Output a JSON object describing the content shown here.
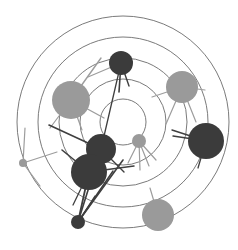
{
  "figure": {
    "title": "",
    "type": "radial-network-graph",
    "width": 238,
    "height": 250,
    "background": "#ffffff"
  },
  "colors": {
    "ring_stroke": "#6b6b6b",
    "node_dark": "#3b3b3b",
    "node_gray": "#9a9a9a",
    "edge_dark": "#3f3f3f",
    "edge_gray": "#9d9d9d"
  },
  "rings": {
    "center_x": 123,
    "center_y": 122,
    "stroke_width": 0.9,
    "radii": [
      106,
      85,
      64,
      43,
      23
    ]
  },
  "nodes": [
    {
      "id": "n1",
      "label": "top-dark",
      "cx": 121,
      "cy": 63,
      "r": 12,
      "color": "#3b3b3b"
    },
    {
      "id": "n2",
      "label": "upper-left-gray",
      "cx": 71,
      "cy": 100,
      "r": 19,
      "color": "#9a9a9a"
    },
    {
      "id": "n3",
      "label": "upper-right-gray",
      "cx": 182,
      "cy": 87,
      "r": 16,
      "color": "#9a9a9a"
    },
    {
      "id": "n4",
      "label": "right-dark",
      "cx": 206,
      "cy": 141,
      "r": 18,
      "color": "#3b3b3b"
    },
    {
      "id": "n5",
      "label": "center-small-gray",
      "cx": 139,
      "cy": 141,
      "r": 7,
      "color": "#9a9a9a"
    },
    {
      "id": "n6",
      "label": "inner-dark-upper",
      "cx": 101,
      "cy": 149,
      "r": 15,
      "color": "#3b3b3b"
    },
    {
      "id": "n7",
      "label": "inner-dark-lower",
      "cx": 89,
      "cy": 172,
      "r": 18,
      "color": "#3b3b3b"
    },
    {
      "id": "n8",
      "label": "bottom-small-dark",
      "cx": 78,
      "cy": 222,
      "r": 7,
      "color": "#3b3b3b"
    },
    {
      "id": "n9",
      "label": "bottom-gray",
      "cx": 158,
      "cy": 215,
      "r": 16,
      "color": "#9a9a9a"
    },
    {
      "id": "n10",
      "label": "far-left-small",
      "cx": 23,
      "cy": 163,
      "r": 4,
      "color": "#9a9a9a"
    }
  ],
  "edges": [
    {
      "x1": 121,
      "y1": 63,
      "x2": 119,
      "y2": 92,
      "color": "#3f3f3f",
      "width": 1.6
    },
    {
      "x1": 121,
      "y1": 63,
      "x2": 129,
      "y2": 86,
      "color": "#3f3f3f",
      "width": 1.4
    },
    {
      "x1": 121,
      "y1": 63,
      "x2": 88,
      "y2": 77,
      "color": "#9d9d9d",
      "width": 1.2
    },
    {
      "x1": 121,
      "y1": 63,
      "x2": 101,
      "y2": 149,
      "color": "#3f3f3f",
      "width": 1.3
    },
    {
      "x1": 71,
      "y1": 100,
      "x2": 101,
      "y2": 58,
      "color": "#9d9d9d",
      "width": 1.4
    },
    {
      "x1": 71,
      "y1": 100,
      "x2": 104,
      "y2": 118,
      "color": "#9d9d9d",
      "width": 1.4
    },
    {
      "x1": 71,
      "y1": 100,
      "x2": 82,
      "y2": 130,
      "color": "#9d9d9d",
      "width": 1.2
    },
    {
      "x1": 71,
      "y1": 100,
      "x2": 50,
      "y2": 128,
      "color": "#9d9d9d",
      "width": 1.2
    },
    {
      "x1": 182,
      "y1": 87,
      "x2": 152,
      "y2": 97,
      "color": "#9d9d9d",
      "width": 1.2
    },
    {
      "x1": 182,
      "y1": 87,
      "x2": 205,
      "y2": 90,
      "color": "#9d9d9d",
      "width": 1.2
    },
    {
      "x1": 182,
      "y1": 87,
      "x2": 196,
      "y2": 122,
      "color": "#9d9d9d",
      "width": 1.2
    },
    {
      "x1": 182,
      "y1": 87,
      "x2": 166,
      "y2": 124,
      "color": "#9d9d9d",
      "width": 1.2
    },
    {
      "x1": 206,
      "y1": 141,
      "x2": 172,
      "y2": 130,
      "color": "#3f3f3f",
      "width": 1.4
    },
    {
      "x1": 206,
      "y1": 141,
      "x2": 173,
      "y2": 136,
      "color": "#3f3f3f",
      "width": 1.4
    },
    {
      "x1": 206,
      "y1": 141,
      "x2": 198,
      "y2": 168,
      "color": "#3f3f3f",
      "width": 1.3
    },
    {
      "x1": 139,
      "y1": 141,
      "x2": 156,
      "y2": 160,
      "color": "#9d9d9d",
      "width": 1.2
    },
    {
      "x1": 139,
      "y1": 141,
      "x2": 149,
      "y2": 166,
      "color": "#9d9d9d",
      "width": 1.2
    },
    {
      "x1": 139,
      "y1": 141,
      "x2": 140,
      "y2": 170,
      "color": "#9d9d9d",
      "width": 1.2
    },
    {
      "x1": 139,
      "y1": 141,
      "x2": 128,
      "y2": 163,
      "color": "#9d9d9d",
      "width": 1.2
    },
    {
      "x1": 101,
      "y1": 149,
      "x2": 49,
      "y2": 125,
      "color": "#3f3f3f",
      "width": 1.6
    },
    {
      "x1": 101,
      "y1": 149,
      "x2": 78,
      "y2": 222,
      "color": "#3f3f3f",
      "width": 1.6
    },
    {
      "x1": 101,
      "y1": 149,
      "x2": 124,
      "y2": 172,
      "color": "#3f3f3f",
      "width": 1.4
    },
    {
      "x1": 89,
      "y1": 172,
      "x2": 78,
      "y2": 222,
      "color": "#3f3f3f",
      "width": 1.8
    },
    {
      "x1": 89,
      "y1": 172,
      "x2": 62,
      "y2": 150,
      "color": "#3f3f3f",
      "width": 1.6
    },
    {
      "x1": 89,
      "y1": 172,
      "x2": 134,
      "y2": 166,
      "color": "#3f3f3f",
      "width": 1.5
    },
    {
      "x1": 89,
      "y1": 172,
      "x2": 73,
      "y2": 205,
      "color": "#3f3f3f",
      "width": 1.3
    },
    {
      "x1": 78,
      "y1": 222,
      "x2": 123,
      "y2": 160,
      "color": "#3f3f3f",
      "width": 1.6
    },
    {
      "x1": 78,
      "y1": 222,
      "x2": 113,
      "y2": 171,
      "color": "#3f3f3f",
      "width": 1.5
    },
    {
      "x1": 78,
      "y1": 222,
      "x2": 95,
      "y2": 196,
      "color": "#3f3f3f",
      "width": 1.3
    },
    {
      "x1": 158,
      "y1": 215,
      "x2": 150,
      "y2": 188,
      "color": "#9d9d9d",
      "width": 1.2
    },
    {
      "x1": 23,
      "y1": 163,
      "x2": 25,
      "y2": 128,
      "color": "#9d9d9d",
      "width": 1.2
    },
    {
      "x1": 23,
      "y1": 163,
      "x2": 57,
      "y2": 152,
      "color": "#9d9d9d",
      "width": 1.2
    },
    {
      "x1": 23,
      "y1": 163,
      "x2": 40,
      "y2": 186,
      "color": "#9d9d9d",
      "width": 1.2
    }
  ]
}
